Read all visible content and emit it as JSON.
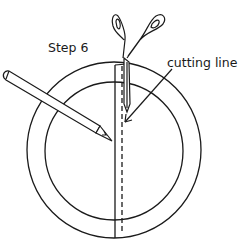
{
  "diagram": {
    "step_label": "Step 6",
    "cutting_label": "cutting line",
    "stroke_color": "#1a1a1a",
    "background": "#ffffff"
  }
}
